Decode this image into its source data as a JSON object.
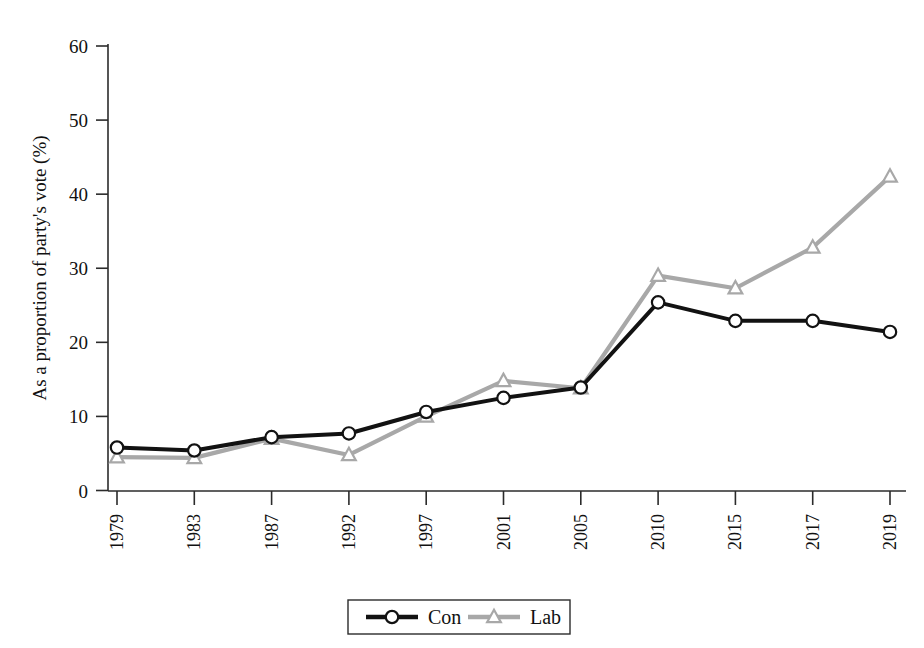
{
  "chart_data": {
    "type": "line",
    "title": "",
    "subtitle": "",
    "xlabel": "",
    "ylabel": "As a proportion of party's vote (%)",
    "categories": [
      "1979",
      "1983",
      "1987",
      "1992",
      "1997",
      "2001",
      "2005",
      "2010",
      "2015",
      "2017",
      "2019"
    ],
    "series": [
      {
        "name": "Con",
        "color": "#121212",
        "marker": "circle",
        "values": [
          5.8,
          5.4,
          7.2,
          7.7,
          10.6,
          12.5,
          13.9,
          25.4,
          22.9,
          22.9,
          21.4
        ]
      },
      {
        "name": "Lab",
        "color": "#a8a8a8",
        "marker": "triangle",
        "values": [
          4.5,
          4.4,
          7.0,
          4.8,
          10.0,
          14.8,
          13.8,
          29.0,
          27.3,
          32.8,
          42.4
        ]
      }
    ],
    "ylim": [
      0,
      60
    ],
    "yticks": [
      0,
      10,
      20,
      30,
      40,
      50,
      60
    ],
    "ytick_labels": [
      "0",
      "10",
      "20",
      "30",
      "40",
      "50",
      "60"
    ],
    "grid": false,
    "legend_position": "bottom-center",
    "legend_entries": [
      "Con",
      "Lab"
    ],
    "xtick_rotation": 90
  },
  "colors": {
    "background": "#ffffff",
    "axis": "#2b2b2b",
    "con": "#121212",
    "lab": "#a8a8a8",
    "text": "#111111"
  }
}
